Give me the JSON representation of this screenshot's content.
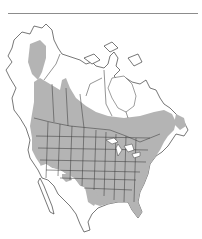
{
  "figure": {
    "type": "species range map",
    "region": "North America",
    "colors": {
      "background": "#ffffff",
      "range_fill": "#b4b4b4",
      "outline": "#3c3c3c",
      "header_rule": "#8c8c8c"
    },
    "range_description": "Shaded range covers interior Alaska, a boreal band across Canada from the Yukon to Newfoundland, and most of the contiguous United States except the arid Southwest; absent from Mexico and the Arctic."
  }
}
